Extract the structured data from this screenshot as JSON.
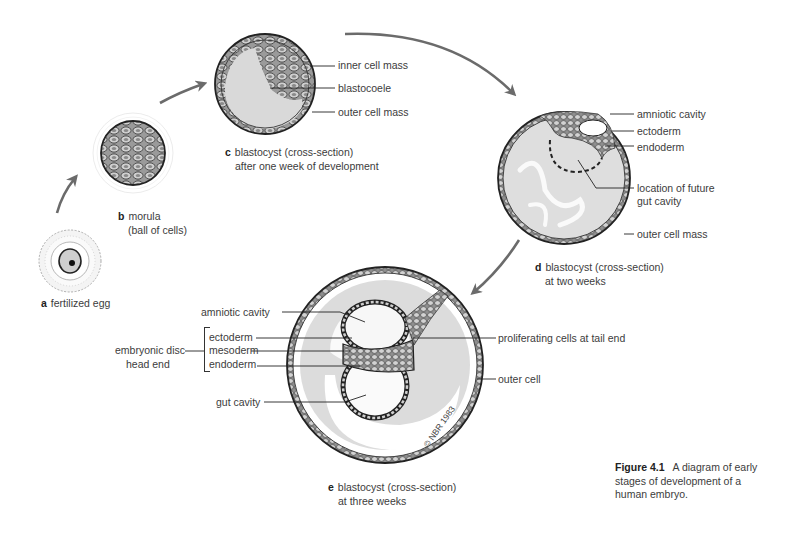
{
  "figure": {
    "number": "Figure 4.1",
    "caption": "A diagram of early stages of development of a human embryo.",
    "caption_lines": [
      "A diagram of early",
      "stages of development of a",
      "human embryo."
    ]
  },
  "stages": [
    {
      "letter": "a",
      "title": "fertilized egg",
      "subtitle": ""
    },
    {
      "letter": "b",
      "title": "morula",
      "subtitle": "(ball of cells)"
    },
    {
      "letter": "c",
      "title": "blastocyst (cross-section)",
      "subtitle": "after one week of development",
      "labels": [
        "inner cell mass",
        "blastocoele",
        "outer cell mass"
      ]
    },
    {
      "letter": "d",
      "title": "blastocyst (cross-section)",
      "subtitle": "at two weeks",
      "labels": [
        "amniotic cavity",
        "ectoderm",
        "endoderm",
        "location of future",
        "gut cavity",
        "outer cell mass"
      ]
    },
    {
      "letter": "e",
      "title": "blastocyst (cross-section)",
      "subtitle": "at three weeks",
      "labels": [
        "amniotic cavity",
        "ectoderm",
        "mesoderm",
        "endoderm",
        "embryonic disc",
        "head end",
        "gut cavity",
        "proliferating cells at tail end",
        "outer cell"
      ]
    }
  ],
  "copyright": "© NBR 1983",
  "colors": {
    "arrow": "#6b6b6b",
    "fill": "#dcdcdc",
    "outline": "#2a2a2a",
    "cell": "#b8b8b8"
  }
}
